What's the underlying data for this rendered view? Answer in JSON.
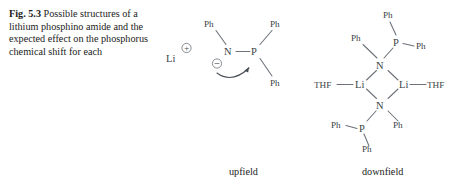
{
  "figure": {
    "label": "Fig. 5.3",
    "caption": "Possible structures of a lithium phosphino amide and the expected effect on the phosphorus chemical shift for each"
  },
  "colors": {
    "background": "#ffffff",
    "text": "#1b1b1b",
    "bond": "#6b7079",
    "atom_label": "#3a3f47"
  },
  "structures": {
    "monomer": {
      "name": "monomeric lithium phosphino amide ion pair",
      "field_label": "upfield",
      "cation": {
        "symbol": "Li",
        "charge": "+",
        "charge_style": "circled"
      },
      "anion": {
        "nitrogen": "N",
        "nitrogen_charge": "−",
        "nitrogen_charge_style": "circled",
        "phosphorus": "P",
        "substituents": [
          {
            "label": "Ph",
            "attached_to": "N",
            "position": "upper-left"
          },
          {
            "label": "Ph",
            "attached_to": "P",
            "position": "upper-right"
          },
          {
            "label": "Ph",
            "attached_to": "P",
            "position": "lower-right"
          }
        ],
        "arrow": "curved electron-pair arrow from N lone pair to P"
      }
    },
    "dimer": {
      "name": "THF-solvated dimer with Li2N2 four-membered ring",
      "field_label": "downfield",
      "ring_atoms": [
        "N",
        "Li",
        "N",
        "Li"
      ],
      "lithium_left": "Li",
      "lithium_right": "Li",
      "nitrogen_top": "N",
      "nitrogen_bottom": "N",
      "solvent_left": "THF",
      "solvent_right": "THF",
      "phosphorus_top": "P",
      "phosphorus_bottom": "P",
      "substituents": [
        {
          "label": "Ph",
          "attached_to": "N-top",
          "position": "upper-left"
        },
        {
          "label": "Ph",
          "attached_to": "P-top",
          "position": "top"
        },
        {
          "label": "Ph",
          "attached_to": "P-top",
          "position": "right"
        },
        {
          "label": "Ph",
          "attached_to": "N-bottom",
          "position": "lower-right"
        },
        {
          "label": "Ph",
          "attached_to": "P-bottom",
          "position": "left"
        },
        {
          "label": "Ph",
          "attached_to": "P-bottom",
          "position": "bottom"
        }
      ]
    }
  },
  "labels": {
    "upfield": "upfield",
    "downfield": "downfield"
  }
}
